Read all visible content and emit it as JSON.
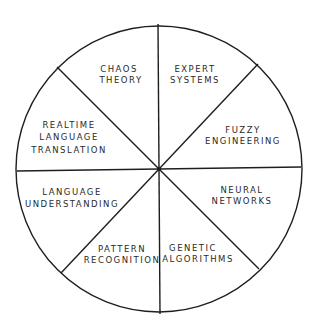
{
  "diagram": {
    "type": "segmented-wheel",
    "colors": {
      "line": "#1e1e1e",
      "text": "#2a2a2a",
      "background": "#ffffff"
    },
    "center": {
      "x": 159,
      "y": 169
    },
    "radius": 143,
    "segments": [
      {
        "id": "expert-systems",
        "lines": [
          "EXPERT",
          "SYSTEMS"
        ],
        "positions": [
          [
            195,
            69
          ],
          [
            195,
            80
          ]
        ]
      },
      {
        "id": "fuzzy-engineering",
        "lines": [
          "FUZZY",
          "ENGINEERING"
        ],
        "positions": [
          [
            243,
            130
          ],
          [
            243,
            141
          ]
        ]
      },
      {
        "id": "neural-networks",
        "lines": [
          "NEURAL",
          "NETWORKS"
        ],
        "positions": [
          [
            242,
            190
          ],
          [
            242,
            201
          ]
        ]
      },
      {
        "id": "genetic-algorithms",
        "lines": [
          "GENETIC",
          "ALGORITHMS"
        ],
        "positions": [
          [
            193,
            248
          ],
          [
            198,
            259
          ]
        ]
      },
      {
        "id": "pattern-recognition",
        "lines": [
          "PATTERN",
          "RECOGNITION"
        ],
        "positions": [
          [
            122,
            249
          ],
          [
            122,
            260
          ]
        ]
      },
      {
        "id": "language-understanding",
        "lines": [
          "LANGUAGE",
          "UNDERSTANDING"
        ],
        "positions": [
          [
            72,
            192
          ],
          [
            72,
            204
          ]
        ]
      },
      {
        "id": "realtime-language-translation",
        "lines": [
          "REALTIME",
          "LANGUAGE",
          "TRANSLATION"
        ],
        "positions": [
          [
            69,
            125
          ],
          [
            69,
            137
          ],
          [
            69,
            150
          ]
        ]
      },
      {
        "id": "chaos-theory",
        "lines": [
          "CHAOS",
          "THEORY"
        ],
        "positions": [
          [
            119,
            69
          ],
          [
            121,
            80
          ]
        ]
      }
    ],
    "dividers": [
      {
        "x1": 158,
        "y1": 24,
        "x2": 160,
        "y2": 314
      },
      {
        "x1": 17,
        "y1": 171,
        "x2": 301,
        "y2": 167
      },
      {
        "x1": 57,
        "y1": 67,
        "x2": 259,
        "y2": 269
      },
      {
        "x1": 258,
        "y1": 64,
        "x2": 61,
        "y2": 273
      }
    ]
  }
}
